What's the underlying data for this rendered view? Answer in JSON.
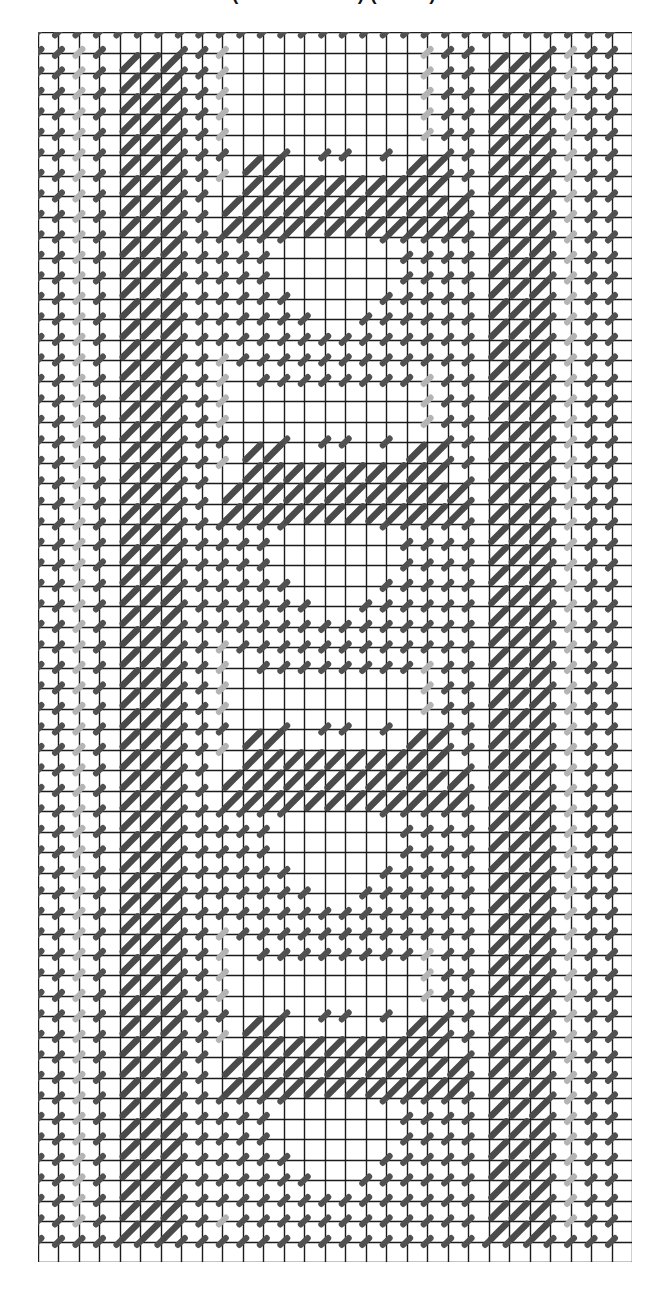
{
  "caption": {
    "text": "(Cross-Stitch) (Chart)"
  },
  "chart_data": {
    "type": "table",
    "grid": {
      "columns": 29,
      "rows": 60,
      "cell_px": 20.5,
      "origin_x": 38,
      "origin_y": 32,
      "width_px": 594,
      "height_px": 1230,
      "line_color": "#1b1b1b",
      "line_width_px": 1.4,
      "background": "#ffffff"
    },
    "symbols": [
      {
        "key": "L",
        "name": "long-diagonal-stitch",
        "color": "#4a4a4a",
        "width_px": 6.5,
        "span": "full-cell",
        "direction": "bottom-left-to-top-right"
      },
      {
        "key": "d",
        "name": "short-diagonal-stitch-dark",
        "color": "#515151",
        "width_px": 6.0,
        "span": "quarter-cell",
        "direction": "bottom-left-to-top-right"
      },
      {
        "key": "g",
        "name": "short-diagonal-stitch-light",
        "color": "#b4b4b4",
        "width_px": 6.0,
        "span": "quarter-cell",
        "direction": "bottom-left-to-top-right"
      }
    ],
    "legend": [
      {
        "symbol": "L",
        "label": "long diagonal stitch (dark)"
      },
      {
        "symbol": "d",
        "label": "short diagonal stitch (dark)"
      },
      {
        "symbol": "g",
        "label": "short diagonal stitch (light grey)"
      }
    ],
    "border_bands": {
      "left_long_columns": [
        4,
        5,
        6
      ],
      "right_long_columns": [
        22,
        23,
        24
      ],
      "left_dark_columns": [
        0,
        1,
        3,
        7,
        8
      ],
      "left_light_columns": [
        2,
        9
      ],
      "right_dark_columns": [
        20,
        21,
        25,
        27,
        28
      ],
      "right_light_columns": [
        19,
        26
      ],
      "top_dark_row": 0,
      "bottom_dark_row": 59
    },
    "motif": {
      "name": "floral-rosette",
      "repeats": 4,
      "repeat_period_rows": 14,
      "first_repeat_top_row": 3,
      "motif_columns": [
        9,
        20
      ],
      "motif_rows_height": 12
    },
    "motif_cells": {
      "L": [
        [
          1,
          3
        ],
        [
          2,
          3
        ],
        [
          1,
          4
        ],
        [
          2,
          4
        ],
        [
          3,
          4
        ],
        [
          4,
          4
        ],
        [
          6,
          4
        ],
        [
          7,
          4
        ],
        [
          8,
          4
        ],
        [
          0,
          5
        ],
        [
          1,
          5
        ],
        [
          2,
          5
        ],
        [
          3,
          5
        ],
        [
          6,
          5
        ],
        [
          7,
          5
        ],
        [
          8,
          5
        ],
        [
          9,
          5
        ],
        [
          0,
          6
        ],
        [
          1,
          6
        ],
        [
          2,
          6
        ],
        [
          6,
          6
        ],
        [
          7,
          6
        ],
        [
          8,
          6
        ]
      ],
      "d": [
        [
          0,
          3
        ],
        [
          3,
          3
        ],
        [
          5,
          3
        ],
        [
          6,
          3
        ],
        [
          9,
          3
        ],
        [
          5,
          4
        ],
        [
          9,
          4
        ],
        [
          10,
          4
        ],
        [
          10,
          5
        ],
        [
          -1,
          6
        ],
        [
          3,
          6
        ],
        [
          4,
          6
        ],
        [
          5,
          6
        ],
        [
          9,
          6
        ],
        [
          10,
          6
        ],
        [
          11,
          6
        ],
        [
          -2,
          7
        ],
        [
          -1,
          7
        ],
        [
          0,
          7
        ],
        [
          1,
          7
        ],
        [
          2,
          7
        ],
        [
          3,
          7
        ],
        [
          9,
          7
        ],
        [
          10,
          7
        ],
        [
          11,
          7
        ],
        [
          12,
          7
        ],
        [
          -2,
          8
        ],
        [
          -1,
          8
        ],
        [
          0,
          8
        ],
        [
          1,
          8
        ],
        [
          2,
          8
        ],
        [
          10,
          8
        ],
        [
          11,
          8
        ],
        [
          12,
          8
        ],
        [
          -2,
          9
        ],
        [
          -1,
          9
        ],
        [
          0,
          9
        ],
        [
          1,
          9
        ],
        [
          2,
          9
        ],
        [
          10,
          9
        ],
        [
          11,
          9
        ],
        [
          12,
          9
        ],
        [
          -2,
          10
        ],
        [
          -1,
          10
        ],
        [
          0,
          10
        ],
        [
          1,
          10
        ],
        [
          2,
          10
        ],
        [
          3,
          10
        ],
        [
          9,
          10
        ],
        [
          10,
          10
        ],
        [
          11,
          10
        ],
        [
          12,
          10
        ],
        [
          -1,
          11
        ],
        [
          0,
          11
        ],
        [
          1,
          11
        ],
        [
          2,
          11
        ],
        [
          3,
          11
        ],
        [
          4,
          11
        ],
        [
          8,
          11
        ],
        [
          9,
          11
        ],
        [
          10,
          11
        ],
        [
          11,
          11
        ],
        [
          0,
          12
        ],
        [
          1,
          12
        ],
        [
          2,
          12
        ],
        [
          3,
          12
        ],
        [
          4,
          12
        ],
        [
          5,
          12
        ],
        [
          6,
          12
        ],
        [
          7,
          12
        ],
        [
          8,
          12
        ],
        [
          9,
          12
        ],
        [
          10,
          12
        ],
        [
          1,
          13
        ],
        [
          2,
          13
        ],
        [
          3,
          13
        ],
        [
          4,
          13
        ],
        [
          5,
          13
        ],
        [
          6,
          13
        ],
        [
          7,
          13
        ],
        [
          8,
          13
        ],
        [
          9,
          13
        ],
        [
          2,
          14
        ],
        [
          3,
          14
        ],
        [
          4,
          14
        ],
        [
          5,
          14
        ],
        [
          6,
          14
        ],
        [
          7,
          14
        ],
        [
          8,
          14
        ]
      ]
    },
    "colors": {
      "ink": "#1b1b1b",
      "stitch_dark": "#4d4d4d",
      "stitch_light": "#b4b4b4",
      "paper": "#ffffff"
    }
  }
}
